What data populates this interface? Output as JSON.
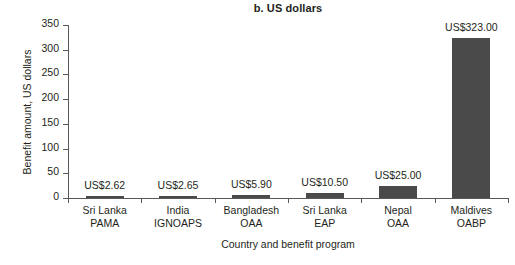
{
  "chart_data": {
    "type": "bar",
    "title": "b. US dollars",
    "xlabel": "Country and benefit program",
    "ylabel": "Benefit amount, US dollars",
    "categories": [
      "Sri Lanka PAMA",
      "India IGNOAPS",
      "Bangladesh OAA",
      "Sri Lanka EAP",
      "Nepal OAA",
      "Maldives OABP"
    ],
    "category_lines": [
      [
        "Sri Lanka",
        "PAMA"
      ],
      [
        "India",
        "IGNOAPS"
      ],
      [
        "Bangladesh",
        "OAA"
      ],
      [
        "Sri Lanka",
        "EAP"
      ],
      [
        "Nepal",
        "OAA"
      ],
      [
        "Maldives",
        "OABP"
      ]
    ],
    "values": [
      2.62,
      2.65,
      5.9,
      10.5,
      25.0,
      323.0
    ],
    "data_labels": [
      "US$2.62",
      "US$2.65",
      "US$5.90",
      "US$10.50",
      "US$25.00",
      "US$323.00"
    ],
    "ylim": [
      0,
      350
    ],
    "yticks": [
      0,
      50,
      100,
      150,
      200,
      250,
      300,
      350
    ],
    "ytick_labels": [
      "0",
      "50",
      "100",
      "150",
      "200",
      "250",
      "300",
      "350"
    ],
    "grid": false,
    "legend": null,
    "bar_color": "#4a4a4a",
    "axis_color": "#58595b",
    "text_color": "#231f20",
    "background": "#ffffff"
  }
}
